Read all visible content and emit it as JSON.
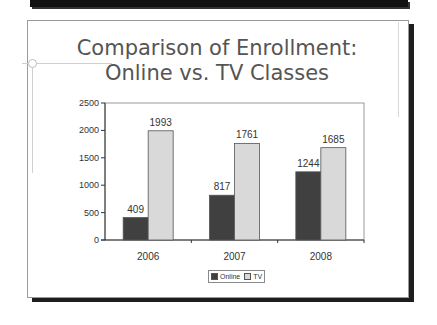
{
  "slide": {
    "title_line1": "Comparison of Enrollment:",
    "title_line2": "Online vs. TV Classes"
  },
  "colors": {
    "online": "#404040",
    "tv": "#d9d9d9",
    "title": "#555555",
    "frame_shadow": "#1e1e1e"
  },
  "chart_data": {
    "type": "bar",
    "title": "Comparison of Enrollment: Online vs. TV Classes",
    "xlabel": "",
    "ylabel": "",
    "categories": [
      "2006",
      "2007",
      "2008"
    ],
    "series": [
      {
        "name": "Online",
        "values": [
          409,
          817,
          1244
        ],
        "color": "#404040"
      },
      {
        "name": "TV",
        "values": [
          1993,
          1761,
          1685
        ],
        "color": "#d9d9d9"
      }
    ],
    "ylim": [
      0,
      2500
    ],
    "yticks": [
      0,
      500,
      1000,
      1500,
      2000,
      2500
    ],
    "grid": false,
    "legend_position": "bottom",
    "data_labels": true
  },
  "legend": {
    "items": [
      {
        "label": "Online",
        "color": "#404040"
      },
      {
        "label": "TV",
        "color": "#d9d9d9"
      }
    ]
  }
}
